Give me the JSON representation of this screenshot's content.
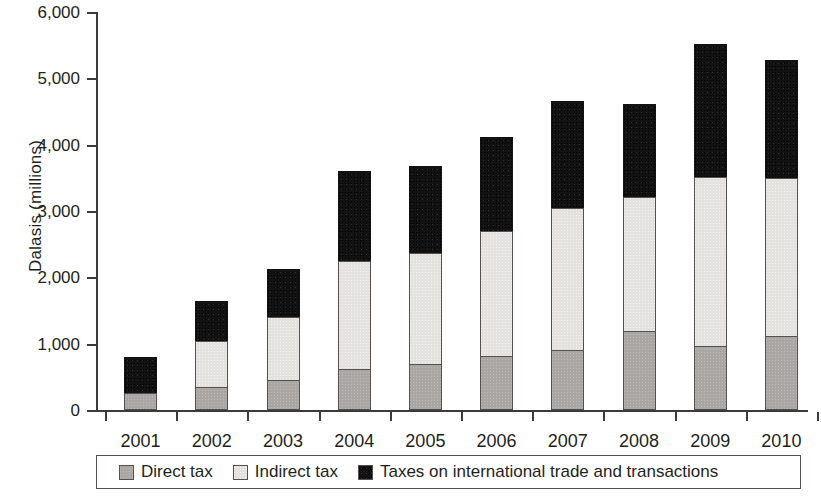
{
  "chart_data": {
    "type": "bar",
    "stacked": true,
    "title": "",
    "subtitle": "",
    "xlabel": "",
    "ylabel": "Dalasis (millions)",
    "categories": [
      "2001",
      "2002",
      "2003",
      "2004",
      "2005",
      "2006",
      "2007",
      "2008",
      "2009",
      "2010"
    ],
    "series": [
      {
        "name": "Direct tax",
        "color": "#a9a6a3",
        "values": [
          250,
          340,
          450,
          620,
          690,
          820,
          900,
          1190,
          970,
          1110
        ]
      },
      {
        "name": "Indirect tax",
        "color": "#e3e2df",
        "values": [
          0,
          700,
          950,
          1630,
          1680,
          1880,
          2150,
          2020,
          2550,
          2390
        ]
      },
      {
        "name": "Taxes on international trade and transactions",
        "color": "#121212",
        "values": [
          550,
          600,
          730,
          1360,
          1310,
          1420,
          1610,
          1400,
          2000,
          1770
        ]
      }
    ],
    "totals": [
      800,
      1640,
      2130,
      3610,
      3680,
      4120,
      4660,
      4610,
      5520,
      5270
    ],
    "ylim": [
      0,
      6000
    ],
    "yticks": [
      0,
      1000,
      2000,
      3000,
      4000,
      5000,
      6000
    ],
    "ytick_labels": [
      "0",
      "1,000",
      "2,000",
      "3,000",
      "4,000",
      "5,000",
      "6,000"
    ],
    "grid": false,
    "legend_position": "bottom"
  },
  "legend": {
    "items": [
      {
        "label": "Direct tax",
        "swatch": "direct-tax-swatch"
      },
      {
        "label": "Indirect tax",
        "swatch": "indirect-tax-swatch"
      },
      {
        "label": "Taxes on international trade and transactions",
        "swatch": "trade-tax-swatch"
      }
    ]
  }
}
